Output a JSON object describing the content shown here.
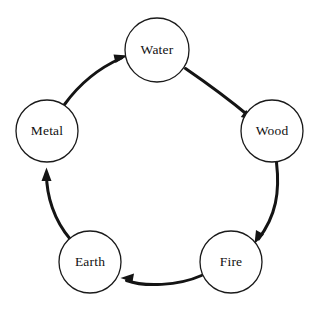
{
  "diagram": {
    "background_color": "#ffffff",
    "stroke_color": "#141414",
    "node_fill_color": "#ffffff",
    "node_stroke_color": "#1a1a1a",
    "label_color": "#111111",
    "direction": "clockwise",
    "nodes": [
      {
        "id": "water",
        "label": "Water",
        "cx": 157,
        "cy": 50,
        "r": 32
      },
      {
        "id": "wood",
        "label": "Wood",
        "cx": 272,
        "cy": 131,
        "r": 31
      },
      {
        "id": "fire",
        "label": "Fire",
        "cx": 231,
        "cy": 262,
        "r": 31
      },
      {
        "id": "earth",
        "label": "Earth",
        "cx": 90,
        "cy": 262,
        "r": 31
      },
      {
        "id": "metal",
        "label": "Metal",
        "cx": 47,
        "cy": 131,
        "r": 31
      }
    ],
    "edges": [
      {
        "id": "water-to-wood",
        "from": "Water",
        "to": "Wood",
        "marker": "arrowhead"
      },
      {
        "id": "wood-to-fire",
        "from": "Wood",
        "to": "Fire",
        "marker": "arrowhead"
      },
      {
        "id": "fire-to-earth",
        "from": "Fire",
        "to": "Earth",
        "marker": "arrowhead"
      },
      {
        "id": "earth-to-metal",
        "from": "Earth",
        "to": "Metal",
        "marker": "arrowhead"
      },
      {
        "id": "metal-to-water",
        "from": "Metal",
        "to": "Water",
        "marker": "arrowhead"
      }
    ]
  }
}
